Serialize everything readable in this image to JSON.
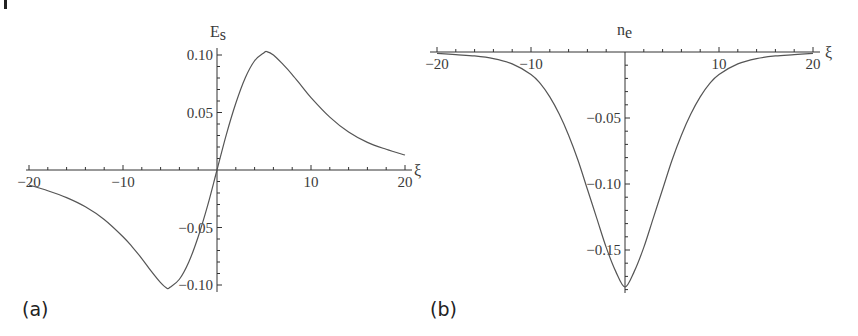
{
  "chart_data": [
    {
      "type": "line",
      "panel": "(a)",
      "title": "",
      "xlabel": "ξ",
      "ylabel": "E_s",
      "ylabel_main": "E",
      "ylabel_sub": "s",
      "xlim": [
        -20,
        20
      ],
      "ylim": [
        -0.105,
        0.105
      ],
      "x_ticks": [
        -20,
        -10,
        10,
        20
      ],
      "x_tick_labels": [
        "-20",
        "-10",
        "10",
        "20"
      ],
      "y_ticks": [
        0.1,
        0.05,
        -0.05,
        -0.1
      ],
      "y_tick_labels": [
        "0.10",
        "0.05",
        "-0.05",
        "-0.10"
      ],
      "grid": false,
      "series": [
        {
          "name": "E_s",
          "x": [
            -20,
            -18,
            -16,
            -14,
            -12,
            -10,
            -9,
            -8,
            -7,
            -6,
            -5.3,
            -5,
            -4,
            -3,
            -2,
            -1,
            0,
            1,
            2,
            3,
            4,
            5,
            5.3,
            6,
            7,
            8,
            9,
            10,
            12,
            14,
            16,
            18,
            20
          ],
          "values": [
            -0.013,
            -0.018,
            -0.024,
            -0.032,
            -0.043,
            -0.058,
            -0.067,
            -0.077,
            -0.088,
            -0.098,
            -0.103,
            -0.102,
            -0.095,
            -0.08,
            -0.058,
            -0.031,
            0.0,
            0.031,
            0.058,
            0.08,
            0.095,
            0.102,
            0.103,
            0.1,
            0.092,
            0.083,
            0.073,
            0.063,
            0.046,
            0.033,
            0.024,
            0.018,
            0.013
          ]
        }
      ]
    },
    {
      "type": "line",
      "panel": "(b)",
      "title": "",
      "xlabel": "ξ",
      "ylabel": "n_e",
      "ylabel_main": "n",
      "ylabel_sub": "e",
      "xlim": [
        -20,
        20
      ],
      "ylim": [
        -0.18,
        0.0
      ],
      "x_ticks": [
        -20,
        -10,
        10,
        20
      ],
      "x_tick_labels": [
        "-20",
        "-10",
        "10",
        "20"
      ],
      "y_ticks": [
        -0.05,
        -0.1,
        -0.15
      ],
      "y_tick_labels": [
        "-0.05",
        "-0.10",
        "-0.15"
      ],
      "grid": false,
      "series": [
        {
          "name": "n_e",
          "x": [
            -20,
            -18,
            -16,
            -14,
            -12,
            -10,
            -9,
            -8,
            -7,
            -6,
            -5,
            -4,
            -3,
            -2,
            -1,
            0,
            1,
            2,
            3,
            4,
            5,
            6,
            7,
            8,
            9,
            10,
            12,
            14,
            16,
            18,
            20
          ],
          "values": [
            -0.001,
            -0.002,
            -0.003,
            -0.005,
            -0.009,
            -0.017,
            -0.024,
            -0.034,
            -0.047,
            -0.063,
            -0.082,
            -0.104,
            -0.126,
            -0.148,
            -0.166,
            -0.178,
            -0.166,
            -0.148,
            -0.126,
            -0.104,
            -0.082,
            -0.063,
            -0.047,
            -0.034,
            -0.024,
            -0.017,
            -0.009,
            -0.005,
            -0.003,
            -0.002,
            -0.001
          ]
        }
      ]
    }
  ],
  "panels": {
    "a": {
      "label": "(a)"
    },
    "b": {
      "label": "(b)"
    }
  },
  "colors": {
    "curve": "#555555",
    "axis": "#333333",
    "text": "#3a3a3a"
  }
}
